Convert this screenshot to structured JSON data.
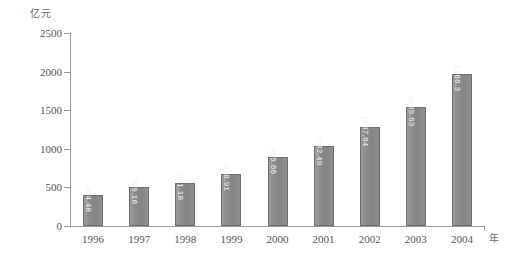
{
  "chart_data": {
    "type": "bar",
    "title": "",
    "xlabel": "年",
    "ylabel": "亿元",
    "ylim": [
      0,
      2500
    ],
    "ytick_labels": [
      "2500",
      "2000",
      "1500",
      "1000",
      "500",
      "0"
    ],
    "ytick_values": [
      2500,
      2000,
      1500,
      1000,
      500,
      0
    ],
    "grid": false,
    "legend": null,
    "categories": [
      "1996",
      "1997",
      "1998",
      "1999",
      "2000",
      "2001",
      "2002",
      "2003",
      "2004"
    ],
    "values": [
      404.48,
      509.16,
      551.18,
      678.91,
      895.66,
      1042.49,
      1287.64,
      1539.63,
      1966.3
    ],
    "value_labels": [
      "404.48",
      "509.16",
      "551.18",
      "678.91",
      "895.66",
      "1042.49",
      "1287.64",
      "1539.63",
      "1966.3"
    ],
    "bar_color": "#8a8a8a",
    "bar_border_color": "#6e6e6e",
    "value_label_color": "#f2f2f2",
    "axis_color": "#9a9a9a"
  },
  "axes": {
    "y_unit": "亿元",
    "x_unit": "年"
  },
  "caption": {
    "text": ""
  }
}
